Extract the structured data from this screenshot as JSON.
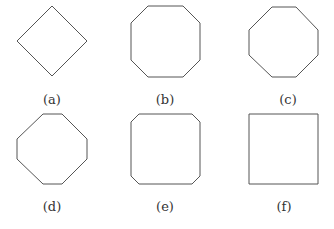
{
  "figure": {
    "panels": [
      {
        "label": "(a)",
        "shape": "diamond",
        "points": "52,6 87,41 52,76 17,41",
        "label_x": 52,
        "label_y": 92
      },
      {
        "label": "(b)",
        "shape": "octagon-large-cut",
        "points": "148,6 183,6 200,23 200,60 183,77 148,77 131,60 131,23",
        "label_x": 165,
        "label_y": 92
      },
      {
        "label": "(c)",
        "shape": "regular-octagon",
        "points": "272,7 296,7 318,30 318,55 296,77 272,77 249,55 249,30",
        "label_x": 288,
        "label_y": 92
      },
      {
        "label": "(d)",
        "shape": "octagon-diamond-like",
        "points": "43,114 62,114 87,139 87,159 62,184 43,184 17,159 17,139",
        "label_x": 52,
        "label_y": 199
      },
      {
        "label": "(e)",
        "shape": "octagon-small-cut",
        "points": "139,114 192,114 200,122 200,176 192,184 139,184 131,176 131,122",
        "label_x": 165,
        "label_y": 199
      },
      {
        "label": "(f)",
        "shape": "square",
        "points": "249,114 318,114 318,184 249,184",
        "label_x": 284,
        "label_y": 199
      }
    ],
    "stroke_color": "#555555"
  }
}
